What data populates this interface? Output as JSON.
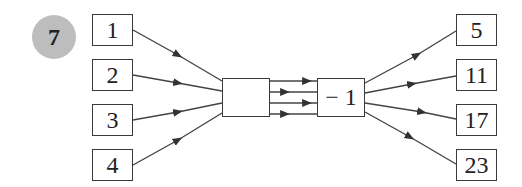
{
  "question_number": "7",
  "inputs": [
    "1",
    "2",
    "3",
    "4"
  ],
  "machine": {
    "first_operation": "",
    "second_operation": "− 1"
  },
  "outputs": [
    "5",
    "11",
    "17",
    "23"
  ]
}
